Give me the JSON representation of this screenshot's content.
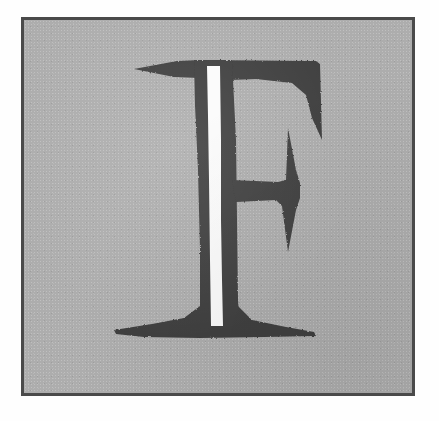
{
  "image": {
    "subject": "letter-F",
    "description": "Large serif capital letter F with a white vertical stripe through its stem, set on a grainy gray square field enclosed by a thin dark border",
    "character": "F",
    "style": "serif",
    "orientation": "upright"
  },
  "canvas": {
    "width": 439,
    "height": 421,
    "background_color": "#fefefe"
  },
  "plate": {
    "name": "bordered-field",
    "left": 21,
    "top": 17,
    "width": 394,
    "height": 379,
    "background_color": "#adadad",
    "border_color": "#4a4a4a",
    "border_width": 3,
    "texture": "grain"
  },
  "letter": {
    "name": "glyph-F",
    "fill_color": "#3f3f3f",
    "stripe_color": "#fbfbfb",
    "bounds": {
      "left": 133,
      "top": 62,
      "right": 320,
      "bottom": 330
    },
    "parts": [
      {
        "name": "top-serif-left-wedge",
        "shape": "tapered-wedge"
      },
      {
        "name": "top-arm",
        "shape": "horizontal-bar"
      },
      {
        "name": "top-arm-terminal-spur",
        "shape": "downward-taper"
      },
      {
        "name": "stem",
        "shape": "vertical-bar"
      },
      {
        "name": "stem-white-stripe",
        "shape": "vertical-stripe"
      },
      {
        "name": "middle-arm",
        "shape": "horizontal-bar"
      },
      {
        "name": "middle-arm-terminal-serif",
        "shape": "vertical-spur"
      },
      {
        "name": "bottom-serif",
        "shape": "flared-foot"
      }
    ]
  },
  "colors": {
    "field": "#adadad",
    "border": "#4a4a4a",
    "ink": "#3f3f3f",
    "stripe": "#fbfbfb",
    "outside": "#fefefe"
  }
}
